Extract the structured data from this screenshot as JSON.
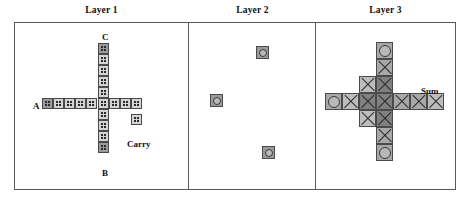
{
  "figure": {
    "width": 471,
    "height": 208,
    "background": "#ffffff",
    "panel_border_color": "#5a5a5a"
  },
  "titles": [
    {
      "text": "Layer 1",
      "x": 101,
      "y": 6
    },
    {
      "text": "Layer 2",
      "x": 252,
      "y": 6
    },
    {
      "text": "Layer 3",
      "x": 385,
      "y": 6
    }
  ],
  "panels": [
    {
      "name": "layer-1",
      "title": "Layer 1",
      "x": 14,
      "y": 22,
      "w": 175,
      "h": 168
    },
    {
      "name": "layer-2",
      "title": "Layer 2",
      "x": 188,
      "y": 22,
      "w": 128,
      "h": 168
    },
    {
      "name": "layer-3",
      "title": "Layer 3",
      "x": 315,
      "y": 22,
      "w": 141,
      "h": 168
    }
  ],
  "colors": {
    "cell_dark": "#9a9a9a",
    "cell_light": "#d4d4d4",
    "x_dark": "#808080",
    "x_mid": "#a8a8a8",
    "x_light": "#bdbdbd",
    "dot": "#2b2b2b",
    "circle_fill": "#b9b9b9",
    "cell_border": "#4a4a4a",
    "text": "#111111"
  },
  "layer1": {
    "label_inputs": [
      "A",
      "B",
      "C"
    ],
    "label_output": "Carry",
    "cell_size": 11,
    "labels": [
      {
        "name": "label-c",
        "text": "C",
        "x": 102,
        "y": 32
      },
      {
        "name": "label-a",
        "text": "A",
        "x": 33,
        "y": 101
      },
      {
        "name": "label-b",
        "text": "B",
        "x": 102,
        "y": 168
      },
      {
        "name": "label-carry",
        "text": "Carry",
        "x": 127,
        "y": 139
      }
    ],
    "cells": [
      {
        "x": 98,
        "y": 43,
        "shade": "dark",
        "motif": "dots"
      },
      {
        "x": 98,
        "y": 54,
        "shade": "light",
        "motif": "dots"
      },
      {
        "x": 98,
        "y": 65,
        "shade": "light",
        "motif": "dots"
      },
      {
        "x": 98,
        "y": 76,
        "shade": "light",
        "motif": "dots"
      },
      {
        "x": 98,
        "y": 87,
        "shade": "light",
        "motif": "dots"
      },
      {
        "x": 42,
        "y": 98,
        "shade": "dark",
        "motif": "dots"
      },
      {
        "x": 53,
        "y": 98,
        "shade": "light",
        "motif": "dots"
      },
      {
        "x": 64,
        "y": 98,
        "shade": "light",
        "motif": "dots"
      },
      {
        "x": 75,
        "y": 98,
        "shade": "light",
        "motif": "dots"
      },
      {
        "x": 86,
        "y": 98,
        "shade": "light",
        "motif": "dots"
      },
      {
        "x": 98,
        "y": 98,
        "shade": "light",
        "motif": "dots"
      },
      {
        "x": 109,
        "y": 98,
        "shade": "light",
        "motif": "dots"
      },
      {
        "x": 120,
        "y": 98,
        "shade": "light",
        "motif": "dots"
      },
      {
        "x": 131,
        "y": 98,
        "shade": "light",
        "motif": "dots"
      },
      {
        "x": 98,
        "y": 109,
        "shade": "light",
        "motif": "dots"
      },
      {
        "x": 131,
        "y": 114,
        "shade": "light",
        "motif": "dots"
      },
      {
        "x": 98,
        "y": 120,
        "shade": "light",
        "motif": "dots"
      },
      {
        "x": 98,
        "y": 131,
        "shade": "light",
        "motif": "dots"
      },
      {
        "x": 98,
        "y": 142,
        "shade": "dark",
        "motif": "dots"
      }
    ]
  },
  "layer2": {
    "cell_size": 13,
    "cells": [
      {
        "x": 256,
        "y": 46,
        "shade": "dark",
        "motif": "circle"
      },
      {
        "x": 210,
        "y": 94,
        "shade": "dark",
        "motif": "circle"
      },
      {
        "x": 262,
        "y": 146,
        "shade": "dark",
        "motif": "circle"
      }
    ]
  },
  "layer3": {
    "label_output": "Sum",
    "cell_size": 17,
    "labels": [
      {
        "name": "label-sum",
        "text": "Sum",
        "x": 421,
        "y": 86
      }
    ],
    "cells": [
      {
        "x": 376,
        "y": 42,
        "shade": "mid",
        "motif": "circle"
      },
      {
        "x": 376,
        "y": 59,
        "shade": "mid",
        "motif": "x"
      },
      {
        "x": 359,
        "y": 76,
        "shade": "light",
        "motif": "x"
      },
      {
        "x": 376,
        "y": 76,
        "shade": "dark",
        "motif": "x"
      },
      {
        "x": 325,
        "y": 93,
        "shade": "mid",
        "motif": "circle"
      },
      {
        "x": 342,
        "y": 93,
        "shade": "light",
        "motif": "x"
      },
      {
        "x": 359,
        "y": 93,
        "shade": "dark",
        "motif": "x"
      },
      {
        "x": 376,
        "y": 93,
        "shade": "dark",
        "motif": "x"
      },
      {
        "x": 393,
        "y": 93,
        "shade": "mid",
        "motif": "x"
      },
      {
        "x": 410,
        "y": 93,
        "shade": "mid",
        "motif": "x"
      },
      {
        "x": 427,
        "y": 93,
        "shade": "light",
        "motif": "x"
      },
      {
        "x": 359,
        "y": 110,
        "shade": "light",
        "motif": "x"
      },
      {
        "x": 376,
        "y": 110,
        "shade": "dark",
        "motif": "x"
      },
      {
        "x": 376,
        "y": 127,
        "shade": "mid",
        "motif": "x"
      },
      {
        "x": 376,
        "y": 144,
        "shade": "mid",
        "motif": "circle"
      }
    ]
  }
}
